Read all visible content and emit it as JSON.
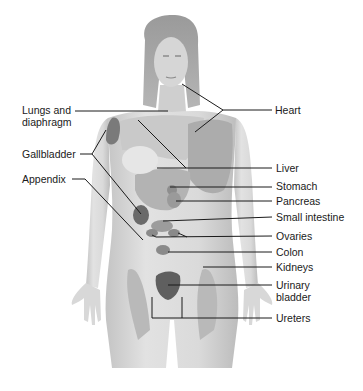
{
  "diagram": {
    "type": "anatomical referred-pain map, anterior female figure",
    "colors": {
      "background": "#ffffff",
      "skin_light": "#dcdcdc",
      "skin_mid": "#bdbdbd",
      "region_mid": "#a9a9a9",
      "organ_dark": "#6e6e6e",
      "leader_line": "#1a1a1a",
      "text": "#1a1a1a"
    },
    "labels_left": [
      {
        "id": "lungs",
        "line1": "Lungs and",
        "line2": "diaphragm"
      },
      {
        "id": "gallbladder",
        "text": "Gallbladder"
      },
      {
        "id": "appendix",
        "text": "Appendix"
      }
    ],
    "labels_right": [
      {
        "id": "heart",
        "text": "Heart"
      },
      {
        "id": "liver",
        "text": "Liver"
      },
      {
        "id": "stomach",
        "text": "Stomach"
      },
      {
        "id": "pancreas",
        "text": "Pancreas"
      },
      {
        "id": "small-intestine",
        "text": "Small intestine"
      },
      {
        "id": "ovaries",
        "text": "Ovaries"
      },
      {
        "id": "colon",
        "text": "Colon"
      },
      {
        "id": "kidneys",
        "text": "Kidneys"
      },
      {
        "id": "urinary-bladder",
        "line1": "Urinary",
        "line2": "bladder"
      },
      {
        "id": "ureters",
        "text": "Ureters"
      }
    ]
  }
}
